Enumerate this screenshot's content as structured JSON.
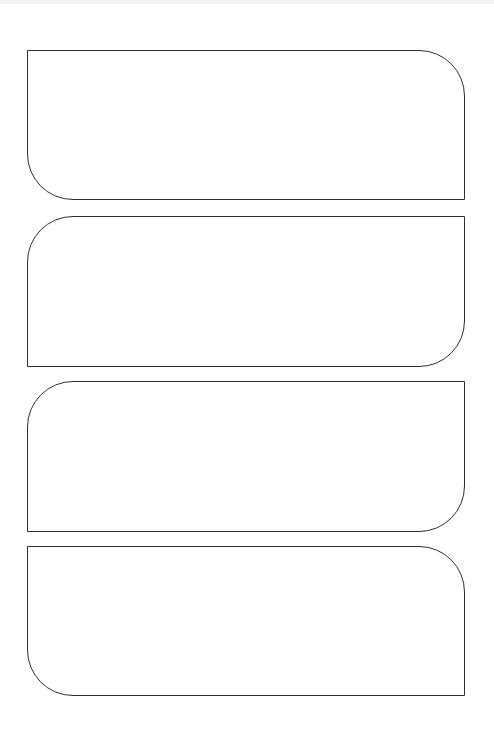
{
  "page": {
    "background": "#ffffff",
    "top_band_color": "#f1f1f1",
    "stroke_color": "#2e2e2e"
  },
  "panels": [
    {
      "index": 1,
      "content": "",
      "rounded_corners": [
        "top-right",
        "bottom-left"
      ],
      "x": 27,
      "y": 50,
      "width": 438,
      "height": 150
    },
    {
      "index": 2,
      "content": "",
      "rounded_corners": [
        "top-left",
        "bottom-right"
      ],
      "x": 27,
      "y": 216,
      "width": 438,
      "height": 151
    },
    {
      "index": 3,
      "content": "",
      "rounded_corners": [
        "top-left",
        "bottom-right"
      ],
      "x": 27,
      "y": 381,
      "width": 438,
      "height": 151
    },
    {
      "index": 4,
      "content": "",
      "rounded_corners": [
        "top-right",
        "bottom-left"
      ],
      "x": 27,
      "y": 546,
      "width": 438,
      "height": 150
    }
  ]
}
